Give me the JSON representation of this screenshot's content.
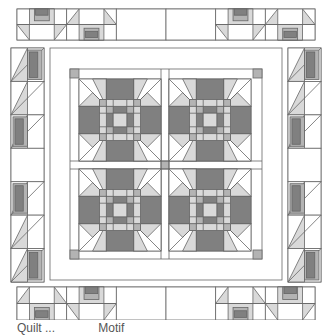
{
  "colors": {
    "background": "#ffffff",
    "line": "#666666",
    "light": "#d9d9d9",
    "medium": "#b3b3b3",
    "dark": "#808080",
    "paper": "#ffffff"
  },
  "layout": {
    "top_strip": {
      "x": 17,
      "y": 9,
      "w": 298,
      "h": 31,
      "blocks": 6
    },
    "bottom_strip": {
      "x": 17,
      "y": 287,
      "w": 298,
      "h": 33,
      "blocks": 6
    },
    "left_column": {
      "x": 11,
      "y": 48,
      "w": 33,
      "h": 234
    },
    "right_column": {
      "x": 288,
      "y": 48,
      "w": 33,
      "h": 234
    },
    "center_frame": {
      "x": 50,
      "y": 48,
      "w": 232,
      "h": 232
    },
    "inner_border": {
      "x": 70,
      "y": 69,
      "w": 192,
      "h": 190
    },
    "blocks_grid": {
      "x": 79,
      "y": 79,
      "block": 82,
      "sash": 8,
      "rows": 2,
      "cols": 2
    }
  },
  "caption": {
    "left": "Quilt ...",
    "right": "Motif"
  }
}
